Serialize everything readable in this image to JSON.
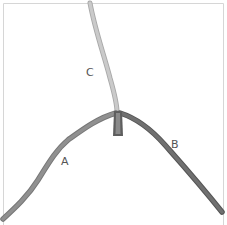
{
  "diagram": {
    "labels": {
      "a": "A",
      "b": "B",
      "c": "C"
    },
    "colors": {
      "frame": "#d4d4d4",
      "string_a": "#8f8f8f",
      "string_a_edge": "#777777",
      "string_b": "#6f6f6f",
      "string_b_edge": "#555555",
      "string_c": "#c9c9c9",
      "string_c_edge": "#a9a9a9",
      "knot": "#5e5e5e"
    }
  }
}
